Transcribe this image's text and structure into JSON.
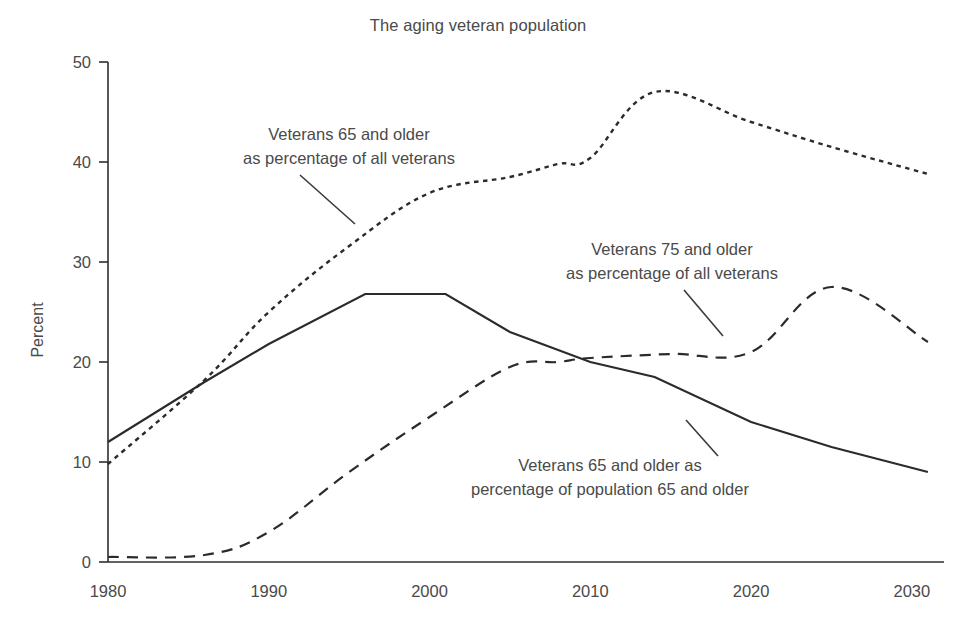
{
  "chart_data": {
    "type": "line",
    "title": "The aging veteran population",
    "xlabel": "",
    "ylabel": "Percent",
    "xlim": [
      1980,
      2032
    ],
    "ylim": [
      0,
      50
    ],
    "xticks": [
      "1980",
      "1990",
      "2000",
      "2010",
      "2020",
      "2030"
    ],
    "xtick_values": [
      1980,
      1990,
      2000,
      2010,
      2020,
      2030
    ],
    "yticks": [
      "0",
      "10",
      "20",
      "30",
      "40",
      "50"
    ],
    "ytick_values": [
      0,
      10,
      20,
      30,
      40,
      50
    ],
    "grid": false,
    "legend_position": "inline-annotations",
    "series": [
      {
        "name": "Veterans 65 and older as percentage of all veterans",
        "style": "dotted",
        "x": [
          1980,
          1986,
          1990,
          1995,
          2000,
          2005,
          2008,
          2010,
          2014,
          2020,
          2025,
          2031
        ],
        "values": [
          9.8,
          18.2,
          25.0,
          31.6,
          36.9,
          38.5,
          39.8,
          40.4,
          47.0,
          44.0,
          41.5,
          38.8
        ]
      },
      {
        "name": "Veterans 75 and older as percentage of all veterans",
        "style": "dashed",
        "x": [
          1980,
          1986,
          1990,
          1995,
          2000,
          2005,
          2008,
          2010,
          2015,
          2020,
          2025,
          2031
        ],
        "values": [
          0.5,
          0.7,
          3.0,
          9.0,
          14.5,
          19.5,
          20.0,
          20.4,
          20.8,
          21.0,
          27.5,
          22.0
        ]
      },
      {
        "name": "Veterans 65 and older as percentage of population 65 and older",
        "style": "solid",
        "x": [
          1980,
          1986,
          1990,
          1996,
          2001,
          2005,
          2010,
          2014,
          2020,
          2025,
          2031
        ],
        "values": [
          12.0,
          18.0,
          21.8,
          26.8,
          26.8,
          23.0,
          20.0,
          18.5,
          14.0,
          11.5,
          9.0
        ]
      }
    ],
    "annotations": [
      {
        "id": "annot-65-all-veterans",
        "line1": "Veterans 65 and older",
        "line2": "as percentage of all veterans",
        "target_series": "Veterans 65 and older as percentage of all veterans"
      },
      {
        "id": "annot-75-all-veterans",
        "line1": "Veterans 75 and older",
        "line2": "as percentage of all veterans",
        "target_series": "Veterans 75 and older as percentage of all veterans"
      },
      {
        "id": "annot-65-population",
        "line1": "Veterans 65 and older as",
        "line2": "percentage of population 65 and older",
        "target_series": "Veterans 65 and older as percentage of population 65 and older"
      }
    ],
    "colors": {
      "background": "#ffffff",
      "ink": "#2b2b2b",
      "text": "#4a4a4a"
    }
  }
}
